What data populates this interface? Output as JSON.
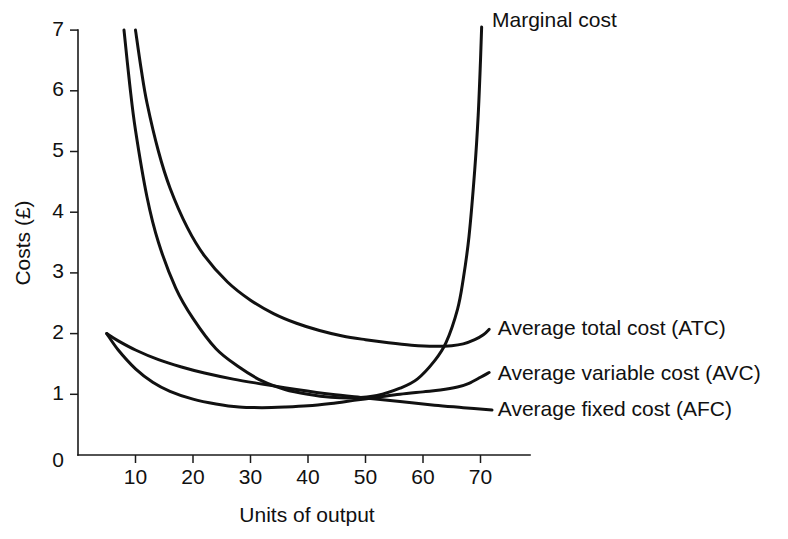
{
  "chart_data": {
    "type": "line",
    "title": "",
    "xlabel": "Units of output",
    "ylabel": "Costs (£)",
    "xlim": [
      0,
      78
    ],
    "ylim": [
      0,
      7.45
    ],
    "xticks": [
      10,
      20,
      30,
      40,
      50,
      60,
      70
    ],
    "yticks": [
      0,
      1,
      2,
      3,
      4,
      5,
      6,
      7
    ],
    "xtick_labels": [
      "10",
      "20",
      "30",
      "40",
      "50",
      "60",
      "70"
    ],
    "ytick_labels": [
      "0",
      "1",
      "2",
      "3",
      "4",
      "5",
      "6",
      "7"
    ],
    "grid": false,
    "legend_position": "right-inline-annotations",
    "line_color": "#111111",
    "axis_color": "#1a1a1a",
    "background": "#ffffff",
    "series": [
      {
        "name": "Marginal cost",
        "abbreviation": "MC",
        "label": "Marginal cost",
        "label_x": 72,
        "label_y": 7.15,
        "x": [
          8,
          9,
          10,
          12,
          14,
          17,
          20,
          24,
          28,
          32,
          36,
          40,
          44,
          48,
          52,
          56,
          59,
          62,
          64,
          66,
          67,
          68,
          69,
          69.6,
          70,
          70.2
        ],
        "y": [
          7.0,
          6.1,
          5.35,
          4.25,
          3.5,
          2.75,
          2.25,
          1.75,
          1.45,
          1.22,
          1.08,
          1.0,
          0.95,
          0.94,
          0.98,
          1.1,
          1.25,
          1.55,
          1.85,
          2.4,
          2.9,
          3.6,
          4.7,
          5.6,
          6.5,
          7.05
        ]
      },
      {
        "name": "Average total cost",
        "abbreviation": "ATC",
        "label": "Average total cost (ATC)",
        "label_x": 73,
        "label_y": 2.07,
        "x": [
          10,
          11,
          12,
          14,
          16,
          19,
          22,
          26,
          30,
          34,
          38,
          42,
          46,
          50,
          54,
          58,
          62,
          65,
          67,
          69,
          70.5,
          71.5
        ],
        "y": [
          7.0,
          6.35,
          5.8,
          5.0,
          4.4,
          3.75,
          3.28,
          2.85,
          2.55,
          2.33,
          2.17,
          2.05,
          1.96,
          1.9,
          1.85,
          1.81,
          1.79,
          1.8,
          1.83,
          1.9,
          1.98,
          2.07
        ]
      },
      {
        "name": "Average variable cost",
        "abbreviation": "AVC",
        "label": "Average variable cost (AVC)",
        "label_x": 73,
        "label_y": 1.33,
        "x": [
          5,
          7,
          10,
          13,
          16,
          20,
          24,
          28,
          32,
          36,
          40,
          44,
          48,
          52,
          56,
          60,
          63,
          66,
          68,
          70,
          71.5
        ],
        "y": [
          2.0,
          1.73,
          1.42,
          1.2,
          1.05,
          0.92,
          0.84,
          0.79,
          0.78,
          0.79,
          0.81,
          0.85,
          0.9,
          0.95,
          1.0,
          1.04,
          1.07,
          1.12,
          1.18,
          1.28,
          1.36
        ]
      },
      {
        "name": "Average fixed cost",
        "abbreviation": "AFC",
        "label": "Average fixed cost (AFC)",
        "label_x": 73,
        "label_y": 0.74,
        "x": [
          5,
          7,
          10,
          14,
          18,
          22,
          27,
          32,
          38,
          44,
          50,
          56,
          62,
          67,
          72
        ],
        "y": [
          2.0,
          1.88,
          1.73,
          1.57,
          1.45,
          1.35,
          1.25,
          1.17,
          1.08,
          1.0,
          0.94,
          0.88,
          0.82,
          0.78,
          0.74
        ]
      }
    ],
    "annotations": [
      {
        "text": "Marginal cost",
        "series": "Marginal cost"
      },
      {
        "text": "Average total cost (ATC)",
        "series": "Average total cost"
      },
      {
        "text": "Average variable cost (AVC)",
        "series": "Average variable cost"
      },
      {
        "text": "Average fixed cost (AFC)",
        "series": "Average fixed cost"
      }
    ]
  }
}
